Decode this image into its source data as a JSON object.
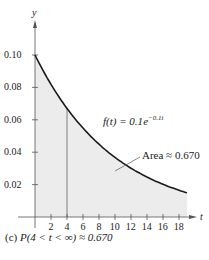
{
  "chart_data": {
    "type": "area",
    "title": "",
    "xlabel": "t",
    "ylabel": "y",
    "function_label_prefix": "f(t) = 0.1",
    "function_label_base": "e",
    "function_label_exp": "−0.1t",
    "annotation": "Area ≈ 0.670",
    "shaded_interval": [
      4,
      19
    ],
    "xlim": [
      0,
      19
    ],
    "ylim": [
      0,
      0.11
    ],
    "x_ticks": [
      "2",
      "4",
      "6",
      "8",
      "10",
      "12",
      "14",
      "16",
      "18"
    ],
    "y_ticks": [
      "0.02",
      "0.04",
      "0.06",
      "0.08",
      "0.10"
    ],
    "x": [
      0,
      2,
      4,
      6,
      8,
      10,
      12,
      14,
      16,
      18,
      19
    ],
    "y": [
      0.1,
      0.0819,
      0.067,
      0.0549,
      0.0449,
      0.0368,
      0.0301,
      0.0247,
      0.0202,
      0.0165,
      0.015
    ],
    "grid": false,
    "colors": {
      "curve": "#1a1a1a",
      "shade": "#ececec",
      "axis": "#555555"
    }
  },
  "caption": {
    "label": "(c)",
    "text": "P(4 < t < ∞) ≈ 0.670"
  }
}
